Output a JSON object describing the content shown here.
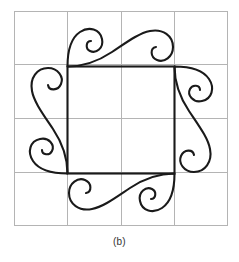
{
  "figure": {
    "caption": "(b)",
    "colors": {
      "background": "#ffffff",
      "grid_line": "#b4b4b4",
      "inner_square": "#1a1a1a",
      "ornament_stroke": "#1a1a1a",
      "caption_text": "#333333"
    },
    "grid": {
      "rows": 4,
      "columns": 4,
      "x_start": 14,
      "y_start": 11,
      "x_end": 228,
      "y_end": 226,
      "cell_width": 53.5,
      "cell_height": 53.75,
      "line_width": 1,
      "x_lines": [
        14,
        67.5,
        121,
        174.5,
        228
      ],
      "y_lines": [
        11,
        64.75,
        118.5,
        172.25,
        226
      ]
    },
    "inner_square": {
      "x": 67.5,
      "y": 66.5,
      "width": 107,
      "height": 107,
      "line_width": 2.1
    },
    "ornaments": [
      {
        "name": "top-scroll",
        "position": "top",
        "rotation_deg": 0,
        "spirals": 2,
        "large_spiral_side": "left",
        "small_spiral_side": "right"
      },
      {
        "name": "right-scroll",
        "position": "right",
        "rotation_deg": 90,
        "spirals": 2,
        "large_spiral_side": "top",
        "small_spiral_side": "bottom"
      },
      {
        "name": "bottom-scroll",
        "position": "bottom",
        "rotation_deg": 180,
        "spirals": 2,
        "large_spiral_side": "right",
        "small_spiral_side": "left"
      },
      {
        "name": "left-scroll",
        "position": "left",
        "rotation_deg": 270,
        "spirals": 2,
        "large_spiral_side": "bottom",
        "small_spiral_side": "top"
      }
    ]
  }
}
